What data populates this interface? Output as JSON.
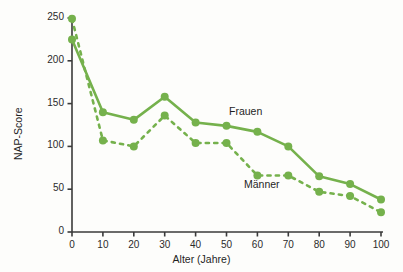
{
  "chart_data": {
    "type": "line",
    "title": "",
    "xlabel": "Alter (Jahre)",
    "ylabel": "NAP-Score",
    "x": [
      0,
      10,
      20,
      30,
      40,
      50,
      60,
      70,
      80,
      90,
      100
    ],
    "xlim": [
      0,
      100
    ],
    "ylim": [
      0,
      250
    ],
    "xticks": [
      "0",
      "10",
      "20",
      "30",
      "40",
      "50",
      "60",
      "70",
      "80",
      "90",
      "100"
    ],
    "yticks": [
      "0",
      "50",
      "100",
      "150",
      "200",
      "250"
    ],
    "grid": false,
    "legend_position": "inline-annotation",
    "series": [
      {
        "name": "Frauen",
        "style": "solid",
        "color": "#74b košuti"
      }
    ]
  },
  "axes": {
    "y_label": "NAP-Score",
    "x_label": "Alter (Jahre)",
    "y_ticks": [
      "250",
      "200",
      "150",
      "100",
      "50",
      "0"
    ],
    "x_ticks": [
      "0",
      "10",
      "20",
      "30",
      "40",
      "50",
      "60",
      "70",
      "80",
      "90",
      "100"
    ]
  },
  "annotations": {
    "frauen": "Frauen",
    "maenner": "Männer"
  },
  "colors": {
    "line": "#76b martes",
    "text": "#1f1f1f",
    "axis": "#3a3a3a",
    "background": "#fdfdfb"
  }
}
